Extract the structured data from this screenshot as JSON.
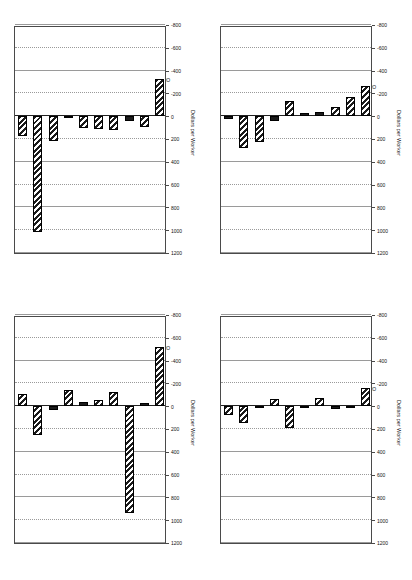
{
  "figure": {
    "panel_count": 4,
    "orientation": "rotated-90-ccw",
    "axis_title": "Dollars per Worker",
    "tick_labels": [
      "1200",
      "1000",
      "800",
      "600",
      "400",
      "200",
      "0",
      "-200",
      "-400",
      "-600",
      "-800"
    ],
    "tick_values": [
      1200,
      1000,
      800,
      600,
      400,
      200,
      0,
      -200,
      -400,
      -600,
      -800
    ],
    "axis_min": -800,
    "axis_max": 1200
  },
  "chart_data": [
    {
      "type": "bar",
      "title": "West Germany",
      "xlabel": "",
      "ylabel": "Dollars per Worker",
      "ylim": [
        -800,
        1200
      ],
      "grid": true,
      "legend": "none",
      "categories": [
        "PETRO",
        "MAT",
        "FOR",
        "TRNSP",
        "ANL",
        "CER",
        "LAB",
        "CAP",
        "MACH",
        "CHEM"
      ],
      "values": [
        -330,
        95,
        40,
        120,
        110,
        105,
        20,
        215,
        1020,
        175
      ]
    },
    {
      "type": "bar",
      "title": "Japan",
      "xlabel": "",
      "ylabel": "Dollars per Worker",
      "ylim": [
        -800,
        1200
      ],
      "grid": true,
      "legend": "none",
      "categories": [
        "PETRO",
        "MAT",
        "FOR",
        "TRNSP",
        "ANL",
        "CER",
        "LAB",
        "CAP",
        "MACH",
        "CHEM"
      ],
      "values": [
        -265,
        -165,
        -85,
        -35,
        -30,
        -135,
        40,
        225,
        280,
        25
      ]
    },
    {
      "type": "bar",
      "title": "Sweden",
      "xlabel": "",
      "ylabel": "Dollars per Worker",
      "ylim": [
        -800,
        1200
      ],
      "grid": true,
      "legend": "none",
      "categories": [
        "PETRO",
        "MAT",
        "FOR",
        "TRNSP",
        "ANL",
        "CER",
        "LAB",
        "CAP",
        "MACH",
        "CHEM"
      ],
      "values": [
        -520,
        -25,
        940,
        -125,
        -55,
        -40,
        -145,
        30,
        255,
        -105
      ]
    },
    {
      "type": "bar",
      "title": "USA",
      "xlabel": "",
      "ylabel": "Dollars per Worker",
      "ylim": [
        -800,
        1200
      ],
      "grid": true,
      "legend": "none",
      "categories": [
        "PETRO",
        "MAT",
        "FOR",
        "TRNSP",
        "ANL",
        "CER",
        "LAB",
        "CAP",
        "MACH",
        "CHEM"
      ],
      "values": [
        -160,
        20,
        25,
        -75,
        15,
        190,
        -60,
        20,
        150,
        75
      ]
    }
  ]
}
